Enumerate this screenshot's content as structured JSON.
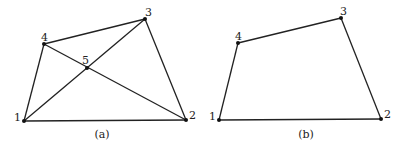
{
  "panels": [
    {
      "id": "a",
      "caption": "(a)",
      "caption_pos": [
        102,
        138
      ],
      "nodes": [
        {
          "id": "1",
          "label": "1",
          "x": 24,
          "y": 121,
          "lx": 14,
          "ly": 121
        },
        {
          "id": "2",
          "label": "2",
          "x": 186,
          "y": 120,
          "lx": 189,
          "ly": 119
        },
        {
          "id": "3",
          "label": "3",
          "x": 145,
          "y": 19,
          "lx": 145,
          "ly": 16
        },
        {
          "id": "4",
          "label": "4",
          "x": 44,
          "y": 44,
          "lx": 41,
          "ly": 41
        },
        {
          "id": "5",
          "label": "5",
          "x": 87,
          "y": 68,
          "lx": 82,
          "ly": 64
        }
      ],
      "edges": [
        [
          "1",
          "2"
        ],
        [
          "2",
          "3"
        ],
        [
          "3",
          "4"
        ],
        [
          "4",
          "1"
        ],
        [
          "1",
          "3"
        ],
        [
          "4",
          "2"
        ]
      ]
    },
    {
      "id": "b",
      "caption": "(b)",
      "caption_pos": [
        306,
        138
      ],
      "nodes": [
        {
          "id": "1",
          "label": "1",
          "x": 219,
          "y": 120,
          "lx": 209,
          "ly": 120
        },
        {
          "id": "2",
          "label": "2",
          "x": 381,
          "y": 119,
          "lx": 384,
          "ly": 118
        },
        {
          "id": "3",
          "label": "3",
          "x": 341,
          "y": 18,
          "lx": 340,
          "ly": 15
        },
        {
          "id": "4",
          "label": "4",
          "x": 238,
          "y": 43,
          "lx": 235,
          "ly": 40
        }
      ],
      "edges": [
        [
          "1",
          "2"
        ],
        [
          "2",
          "3"
        ],
        [
          "3",
          "4"
        ],
        [
          "4",
          "1"
        ]
      ]
    }
  ]
}
